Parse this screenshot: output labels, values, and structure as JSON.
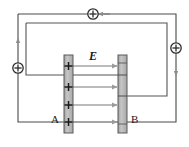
{
  "figure": {
    "kind": "physics-circuit-diagram",
    "width": 189,
    "height": 147,
    "background_color": "#ffffff"
  },
  "colors": {
    "wire": "#4a4a4a",
    "wire_inner": "#555555",
    "plate_fill": "#b8b8b8",
    "plate_stroke": "#555555",
    "field_arrow": "#9a9a9a",
    "charge_symbol": "#2b2b2b",
    "current_arrow": "#8d8d8d",
    "text": "#1a1a1a"
  },
  "labels": {
    "plate_a": "A",
    "plate_b": "B",
    "field": "E"
  },
  "plates": [
    {
      "id": "plate-a",
      "label": "A",
      "charge_count": 4,
      "charge_sign": "+"
    },
    {
      "id": "plate-b",
      "label": "B",
      "charge_count": 0,
      "charge_sign": ""
    }
  ],
  "field_lines": {
    "count": 4,
    "direction": "left-to-right",
    "symbol": "E"
  },
  "current_markers": [
    {
      "id": "current-marker-top",
      "glyph": "+",
      "arrow_direction": "left"
    },
    {
      "id": "current-marker-left",
      "glyph": "+",
      "arrow_direction": "up"
    },
    {
      "id": "current-marker-right",
      "glyph": "+",
      "arrow_direction": "down"
    }
  ],
  "loops": [
    {
      "id": "outer-loop",
      "shape": "rectangle"
    },
    {
      "id": "inner-loop",
      "shape": "rectangle"
    }
  ]
}
